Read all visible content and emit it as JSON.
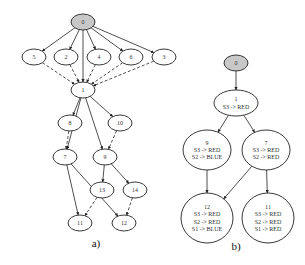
{
  "figure": {
    "panel_a": {
      "caption": "a)",
      "nodes": [
        {
          "id": "0",
          "label": "0",
          "x": 83,
          "y": 22,
          "rx": 12,
          "ry": 8,
          "root": true
        },
        {
          "id": "5",
          "label": "5",
          "x": 34,
          "y": 57,
          "rx": 12,
          "ry": 8
        },
        {
          "id": "2",
          "label": "2",
          "x": 66,
          "y": 57,
          "rx": 12,
          "ry": 8
        },
        {
          "id": "4",
          "label": "4",
          "x": 99,
          "y": 57,
          "rx": 12,
          "ry": 8
        },
        {
          "id": "6",
          "label": "6",
          "x": 131,
          "y": 57,
          "rx": 12,
          "ry": 8
        },
        {
          "id": "3",
          "label": "3",
          "x": 164,
          "y": 57,
          "rx": 12,
          "ry": 8
        },
        {
          "id": "1",
          "label": "1",
          "x": 83,
          "y": 90,
          "rx": 12,
          "ry": 8
        },
        {
          "id": "8",
          "label": "8",
          "x": 70,
          "y": 123,
          "rx": 12,
          "ry": 8
        },
        {
          "id": "10",
          "label": "10",
          "x": 120,
          "y": 123,
          "rx": 12,
          "ry": 8
        },
        {
          "id": "7",
          "label": "7",
          "x": 65,
          "y": 157,
          "rx": 12,
          "ry": 8
        },
        {
          "id": "9",
          "label": "9",
          "x": 105,
          "y": 157,
          "rx": 12,
          "ry": 8
        },
        {
          "id": "13",
          "label": "13",
          "x": 102,
          "y": 190,
          "rx": 12,
          "ry": 8
        },
        {
          "id": "14",
          "label": "14",
          "x": 135,
          "y": 190,
          "rx": 12,
          "ry": 8
        },
        {
          "id": "11",
          "label": "11",
          "x": 80,
          "y": 223,
          "rx": 12,
          "ry": 8
        },
        {
          "id": "12",
          "label": "12",
          "x": 124,
          "y": 223,
          "rx": 12,
          "ry": 8
        }
      ],
      "edges": [
        {
          "from": "0",
          "to": "5",
          "style": "solid"
        },
        {
          "from": "0",
          "to": "2",
          "style": "solid"
        },
        {
          "from": "0",
          "to": "4",
          "style": "solid"
        },
        {
          "from": "0",
          "to": "6",
          "style": "solid"
        },
        {
          "from": "0",
          "to": "3",
          "style": "solid"
        },
        {
          "from": "0",
          "to": "1",
          "style": "solid"
        },
        {
          "from": "5",
          "to": "1",
          "style": "dashed"
        },
        {
          "from": "2",
          "to": "1",
          "style": "dashed"
        },
        {
          "from": "4",
          "to": "1",
          "style": "dashed"
        },
        {
          "from": "6",
          "to": "1",
          "style": "dashed"
        },
        {
          "from": "3",
          "to": "1",
          "style": "dashed"
        },
        {
          "from": "1",
          "to": "8",
          "style": "solid"
        },
        {
          "from": "1",
          "to": "10",
          "style": "solid"
        },
        {
          "from": "1",
          "to": "7",
          "style": "solid"
        },
        {
          "from": "1",
          "to": "9",
          "style": "solid"
        },
        {
          "from": "8",
          "to": "7",
          "style": "dashed"
        },
        {
          "from": "10",
          "to": "9",
          "style": "dashed"
        },
        {
          "from": "9",
          "to": "13",
          "style": "solid"
        },
        {
          "from": "9",
          "to": "14",
          "style": "solid"
        },
        {
          "from": "7",
          "to": "11",
          "style": "solid"
        },
        {
          "from": "7",
          "to": "12",
          "style": "solid"
        },
        {
          "from": "13",
          "to": "11",
          "style": "dashed"
        },
        {
          "from": "14",
          "to": "12",
          "style": "dashed"
        }
      ]
    },
    "panel_b": {
      "caption": "b)",
      "nodes": [
        {
          "id": "0",
          "lines": [
            "0"
          ],
          "x": 236,
          "y": 63,
          "rx": 12,
          "ry": 8,
          "root": true
        },
        {
          "id": "1",
          "lines": [
            "1",
            "S3 -> RED"
          ],
          "x": 236,
          "y": 103,
          "rx": 22,
          "ry": 13
        },
        {
          "id": "9",
          "lines": [
            "9",
            "S3 -> RED",
            "S2 -> BLUE"
          ],
          "x": 207,
          "y": 150,
          "rx": 24,
          "ry": 20
        },
        {
          "id": "7",
          "lines": [
            "7",
            "S3 -> RED",
            "S2 -> RED"
          ],
          "x": 266,
          "y": 150,
          "rx": 24,
          "ry": 20
        },
        {
          "id": "12",
          "lines": [
            "12",
            "S3 -> RED",
            "S2 -> RED",
            "S1 -> BLUE"
          ],
          "x": 207,
          "y": 218,
          "rx": 26,
          "ry": 25
        },
        {
          "id": "11",
          "lines": [
            "11",
            "S3 -> RED",
            "S2 -> RED",
            "S1 -> RED"
          ],
          "x": 268,
          "y": 218,
          "rx": 26,
          "ry": 25
        }
      ],
      "edges": [
        {
          "from": "0",
          "to": "1",
          "style": "solid"
        },
        {
          "from": "1",
          "to": "9",
          "style": "solid"
        },
        {
          "from": "1",
          "to": "7",
          "style": "solid"
        },
        {
          "from": "9",
          "to": "12",
          "style": "solid"
        },
        {
          "from": "7",
          "to": "12",
          "style": "solid"
        },
        {
          "from": "7",
          "to": "11",
          "style": "solid"
        }
      ]
    }
  }
}
